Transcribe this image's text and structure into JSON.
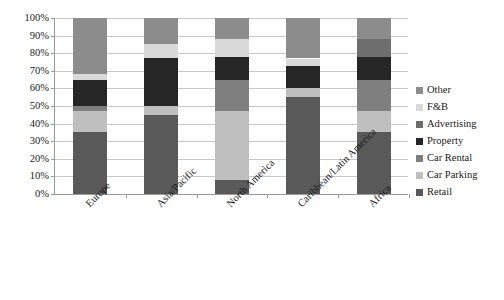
{
  "chart_data": {
    "type": "bar",
    "stacked": true,
    "normalized": true,
    "title": "",
    "subtitle": "",
    "xlabel": "",
    "ylabel": "",
    "ylim": [
      0,
      100
    ],
    "grid": true,
    "legend_position": "right",
    "categories": [
      "Europe",
      "Asia/Pacific",
      "North America",
      "Caribbean/Latin America",
      "Africa"
    ],
    "y_ticks": [
      "0%",
      "10%",
      "20%",
      "30%",
      "40%",
      "50%",
      "60%",
      "70%",
      "80%",
      "90%",
      "100%"
    ],
    "y_tick_values": [
      0,
      10,
      20,
      30,
      40,
      50,
      60,
      70,
      80,
      90,
      100
    ],
    "series": [
      {
        "name": "Retail",
        "color": "#595959",
        "values": [
          35,
          45,
          8,
          55,
          35
        ]
      },
      {
        "name": "Car Parking",
        "color": "#bfbfbf",
        "values": [
          12,
          5,
          39,
          5,
          12
        ]
      },
      {
        "name": "Car Rental",
        "color": "#7f7f7f",
        "values": [
          3,
          0,
          18,
          0,
          18
        ]
      },
      {
        "name": "Property",
        "color": "#262626",
        "values": [
          15,
          27,
          13,
          13,
          13
        ]
      },
      {
        "name": "Advertising",
        "color": "#6e6e6e",
        "values": [
          0,
          0,
          0,
          0,
          10
        ]
      },
      {
        "name": "F&B",
        "color": "#d9d9d9",
        "values": [
          3,
          8,
          10,
          4,
          0
        ]
      },
      {
        "name": "Other",
        "color": "#8c8c8c",
        "values": [
          32,
          15,
          12,
          23,
          12
        ]
      }
    ],
    "legend_entries": [
      {
        "label": "Other",
        "color": "#8c8c8c"
      },
      {
        "label": "F&B",
        "color": "#d9d9d9"
      },
      {
        "label": "Advertising",
        "color": "#6e6e6e"
      },
      {
        "label": "Property",
        "color": "#262626"
      },
      {
        "label": "Car Rental",
        "color": "#7f7f7f"
      },
      {
        "label": "Car Parking",
        "color": "#bfbfbf"
      },
      {
        "label": "Retail",
        "color": "#595959"
      }
    ],
    "axis_color": "#9a9a9a",
    "grid_color": "#c8c8c8",
    "text_color": "#1a1a1a",
    "background": "#ffffff"
  }
}
